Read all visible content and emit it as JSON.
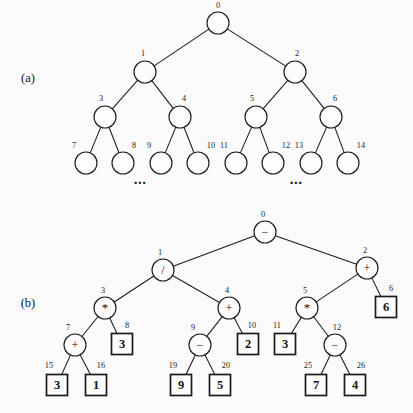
{
  "figure": {
    "background_color": "#fbfbfb",
    "ink_color": "#1b1b1b",
    "width": 413,
    "height": 413
  },
  "panels": [
    {
      "id": "panel-a",
      "label": "(a)",
      "label_x": 28,
      "label_y": 82,
      "caption_note": "Complete binary tree with breadth-first node indices",
      "ellipses": [
        {
          "text": "...",
          "x": 140,
          "y": 184
        },
        {
          "text": "...",
          "x": 296,
          "y": 184
        }
      ],
      "nodes": [
        {
          "index": "0",
          "x": 218,
          "y": 23,
          "shape": "circle",
          "r": 11,
          "symbol": "",
          "idx_x": 218,
          "idx_y": 8
        },
        {
          "index": "1",
          "x": 145,
          "y": 72,
          "shape": "circle",
          "r": 11,
          "symbol": "",
          "idx_x": 143,
          "idx_y": 56
        },
        {
          "index": "2",
          "x": 295,
          "y": 72,
          "shape": "circle",
          "r": 11,
          "symbol": "",
          "idx_x": 297,
          "idx_y": 56
        },
        {
          "index": "3",
          "x": 105,
          "y": 117,
          "shape": "circle",
          "r": 11,
          "symbol": "",
          "idx_x": 101,
          "idx_y": 101
        },
        {
          "index": "4",
          "x": 180,
          "y": 117,
          "shape": "circle",
          "r": 11,
          "symbol": "",
          "idx_x": 184,
          "idx_y": 101
        },
        {
          "index": "5",
          "x": 256,
          "y": 117,
          "shape": "circle",
          "r": 11,
          "symbol": "",
          "idx_x": 252,
          "idx_y": 101
        },
        {
          "index": "6",
          "x": 331,
          "y": 117,
          "shape": "circle",
          "r": 11,
          "symbol": "",
          "idx_x": 335,
          "idx_y": 101
        },
        {
          "index": "7",
          "x": 86,
          "y": 163,
          "shape": "circle",
          "r": 11,
          "symbol": "",
          "idx_x": 74,
          "idx_y": 148
        },
        {
          "index": "8",
          "x": 123,
          "y": 163,
          "shape": "circle",
          "r": 11,
          "symbol": "",
          "idx_x": 134,
          "idx_y": 148
        },
        {
          "index": "9",
          "x": 161,
          "y": 163,
          "shape": "circle",
          "r": 11,
          "symbol": "",
          "idx_x": 149,
          "idx_y": 148
        },
        {
          "index": "10",
          "x": 198,
          "y": 163,
          "shape": "circle",
          "r": 11,
          "symbol": "",
          "idx_x": 211,
          "idx_y": 148
        },
        {
          "index": "11",
          "x": 236,
          "y": 163,
          "shape": "circle",
          "r": 11,
          "symbol": "",
          "idx_x": 224,
          "idx_y": 148
        },
        {
          "index": "12",
          "x": 273,
          "y": 163,
          "shape": "circle",
          "r": 11,
          "symbol": "",
          "idx_x": 286,
          "idx_y": 148
        },
        {
          "index": "13",
          "x": 311,
          "y": 163,
          "shape": "circle",
          "r": 11,
          "symbol": "",
          "idx_x": 299,
          "idx_y": 148
        },
        {
          "index": "14",
          "x": 348,
          "y": 163,
          "shape": "circle",
          "r": 11,
          "symbol": "",
          "idx_x": 361,
          "idx_y": 148
        }
      ],
      "edges": [
        {
          "from": "0",
          "to": "1"
        },
        {
          "from": "0",
          "to": "2"
        },
        {
          "from": "1",
          "to": "3"
        },
        {
          "from": "1",
          "to": "4"
        },
        {
          "from": "2",
          "to": "5"
        },
        {
          "from": "2",
          "to": "6"
        },
        {
          "from": "3",
          "to": "7"
        },
        {
          "from": "3",
          "to": "8"
        },
        {
          "from": "4",
          "to": "9"
        },
        {
          "from": "4",
          "to": "10"
        },
        {
          "from": "5",
          "to": "11"
        },
        {
          "from": "5",
          "to": "12"
        },
        {
          "from": "6",
          "to": "13"
        },
        {
          "from": "6",
          "to": "14"
        }
      ]
    },
    {
      "id": "panel-b",
      "label": "(b)",
      "label_x": 28,
      "label_y": 307,
      "caption_note": "Expression tree with operator and operand nodes",
      "ellipses": [],
      "nodes": [
        {
          "index": "0",
          "x": 265,
          "y": 232,
          "shape": "circle",
          "r": 11,
          "symbol": "−",
          "idx_x": 263,
          "idx_y": 217
        },
        {
          "index": "1",
          "x": 163,
          "y": 270,
          "shape": "circle",
          "r": 11,
          "symbol": "/",
          "idx_x": 160,
          "idx_y": 255
        },
        {
          "index": "2",
          "x": 367,
          "y": 268,
          "shape": "circle",
          "r": 11,
          "symbol": "+",
          "idx_x": 365,
          "idx_y": 253
        },
        {
          "index": "3",
          "x": 105,
          "y": 308,
          "shape": "circle",
          "r": 11,
          "symbol": "*",
          "idx_x": 103,
          "idx_y": 293
        },
        {
          "index": "4",
          "x": 229,
          "y": 308,
          "shape": "circle",
          "r": 11,
          "symbol": "+",
          "idx_x": 227,
          "idx_y": 293
        },
        {
          "index": "5",
          "x": 307,
          "y": 308,
          "shape": "circle",
          "r": 11,
          "symbol": "*",
          "idx_x": 305,
          "idx_y": 293
        },
        {
          "index": "6",
          "x": 386,
          "y": 307,
          "shape": "box",
          "r": 10.5,
          "symbol": "6",
          "idx_x": 391,
          "idx_y": 291
        },
        {
          "index": "7",
          "x": 75,
          "y": 345,
          "shape": "circle",
          "r": 11,
          "symbol": "+",
          "idx_x": 68,
          "idx_y": 330
        },
        {
          "index": "8",
          "x": 122,
          "y": 344,
          "shape": "box",
          "r": 10.5,
          "symbol": "3",
          "idx_x": 127,
          "idx_y": 328
        },
        {
          "index": "9",
          "x": 200,
          "y": 345,
          "shape": "circle",
          "r": 11,
          "symbol": "−",
          "idx_x": 193,
          "idx_y": 330
        },
        {
          "index": "10",
          "x": 248,
          "y": 344,
          "shape": "box",
          "r": 10.5,
          "symbol": "2",
          "idx_x": 252,
          "idx_y": 328
        },
        {
          "index": "11",
          "x": 285,
          "y": 344,
          "shape": "box",
          "r": 10.5,
          "symbol": "3",
          "idx_x": 277,
          "idx_y": 328
        },
        {
          "index": "12",
          "x": 335,
          "y": 345,
          "shape": "circle",
          "r": 11,
          "symbol": "−",
          "idx_x": 337,
          "idx_y": 330
        },
        {
          "index": "15",
          "x": 57,
          "y": 385,
          "shape": "box",
          "r": 10.5,
          "symbol": "3",
          "idx_x": 49,
          "idx_y": 368
        },
        {
          "index": "16",
          "x": 96,
          "y": 385,
          "shape": "box",
          "r": 10.5,
          "symbol": "1",
          "idx_x": 101,
          "idx_y": 368
        },
        {
          "index": "19",
          "x": 181,
          "y": 385,
          "shape": "box",
          "r": 10.5,
          "symbol": "9",
          "idx_x": 173,
          "idx_y": 368
        },
        {
          "index": "20",
          "x": 220,
          "y": 385,
          "shape": "box",
          "r": 10.5,
          "symbol": "5",
          "idx_x": 226,
          "idx_y": 368
        },
        {
          "index": "25",
          "x": 316,
          "y": 385,
          "shape": "box",
          "r": 10.5,
          "symbol": "7",
          "idx_x": 308,
          "idx_y": 368
        },
        {
          "index": "26",
          "x": 355,
          "y": 385,
          "shape": "box",
          "r": 10.5,
          "symbol": "4",
          "idx_x": 361,
          "idx_y": 368
        }
      ],
      "edges": [
        {
          "from": "0",
          "to": "1"
        },
        {
          "from": "0",
          "to": "2"
        },
        {
          "from": "1",
          "to": "3"
        },
        {
          "from": "1",
          "to": "4"
        },
        {
          "from": "2",
          "to": "5"
        },
        {
          "from": "2",
          "to": "6"
        },
        {
          "from": "3",
          "to": "7"
        },
        {
          "from": "3",
          "to": "8"
        },
        {
          "from": "4",
          "to": "9"
        },
        {
          "from": "4",
          "to": "10"
        },
        {
          "from": "5",
          "to": "11"
        },
        {
          "from": "5",
          "to": "12"
        },
        {
          "from": "7",
          "to": "15"
        },
        {
          "from": "7",
          "to": "16"
        },
        {
          "from": "9",
          "to": "19"
        },
        {
          "from": "9",
          "to": "20"
        },
        {
          "from": "12",
          "to": "25"
        },
        {
          "from": "12",
          "to": "26"
        }
      ]
    }
  ]
}
